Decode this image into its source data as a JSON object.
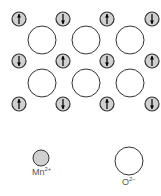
{
  "colors": {
    "mn_fill": "#d0d0d0",
    "o_fill": "#ffffff",
    "stroke": "#333333"
  },
  "lattice": {
    "mn_columns_x": [
      19,
      63,
      107,
      152
    ],
    "mn_rows_y": [
      19,
      61,
      104
    ],
    "mn_radius": 7,
    "o_columns_x": [
      42,
      86,
      130
    ],
    "o_rows_y": [
      40,
      83
    ],
    "o_radius": 14,
    "spins": [
      [
        "up",
        "down",
        "up",
        "down"
      ],
      [
        "down",
        "up",
        "down",
        "up"
      ],
      [
        "up",
        "down",
        "up",
        "down"
      ]
    ]
  },
  "legend": {
    "mn": {
      "label": "Mn",
      "charge": "2+"
    },
    "o": {
      "label": "O",
      "charge": "2−"
    }
  }
}
